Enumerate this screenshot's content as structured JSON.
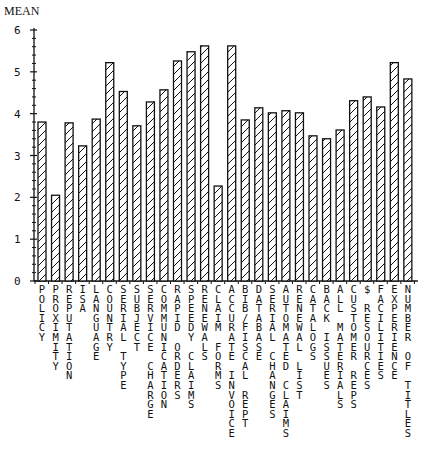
{
  "chart_data": {
    "type": "bar",
    "title": "",
    "ylabel": "MEAN",
    "xlabel": "",
    "ylim": [
      0,
      6
    ],
    "yticks": [
      0,
      1,
      2,
      3,
      4,
      5,
      6
    ],
    "minor_ticks_per_unit": 5,
    "grid": false,
    "legend": "none",
    "bar_fill": "diagonal-hatch",
    "bar_color": "#111111",
    "categories": [
      "POLICY",
      "PROXIMITY",
      "REPUTATION",
      "ISA",
      "LANGUAGE",
      "COUNTRY",
      "SERIAL TYPE",
      "SUBJECT",
      "SERVICE CHARGE",
      "COMMUNICATION",
      "RAPID ORDERS",
      "SPEEDY CLAIMS",
      "RENEWALS",
      "CLAIM FORMS",
      "ACCURATE INVOICE",
      "BIB/FISCAL REPT",
      "DATABASE",
      "SERIAL CHANGES",
      "AUTOMATED CLAIMS",
      "RENEWAL LIST",
      "CATALOGS",
      "BACK ISSUES",
      "ALL MATERIALS",
      "CUSTOMER REPS",
      "$ RESOURCES",
      "FACILITIES",
      "EXPERIENCE",
      "NUMBER OF TITLES"
    ],
    "values": [
      3.8,
      2.05,
      3.78,
      3.23,
      3.87,
      5.22,
      4.53,
      3.71,
      4.28,
      4.57,
      5.26,
      5.48,
      5.62,
      2.27,
      5.62,
      3.85,
      4.14,
      4.02,
      4.07,
      4.02,
      3.47,
      3.4,
      3.61,
      4.31,
      4.4,
      4.16,
      5.22,
      4.83
    ]
  }
}
